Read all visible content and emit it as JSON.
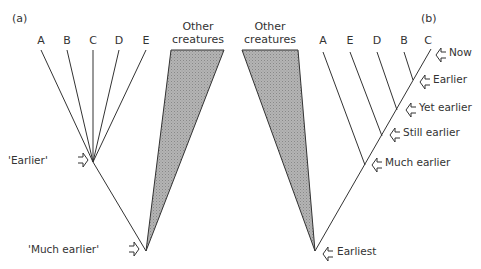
{
  "panel_a": {
    "label": "(a)",
    "leaves": [
      "A",
      "B",
      "C",
      "D",
      "E"
    ],
    "other_label_1": "Other",
    "other_label_2": "creatures",
    "nodes": [
      {
        "label": "'Earlier'"
      },
      {
        "label": "'Much earlier'"
      }
    ]
  },
  "panel_b": {
    "label": "(b)",
    "leaves": [
      "A",
      "E",
      "D",
      "B",
      "C"
    ],
    "other_label_1": "Other",
    "other_label_2": "creatures",
    "nodes": [
      {
        "label": "Now"
      },
      {
        "label": "Earlier"
      },
      {
        "label": "Yet earlier"
      },
      {
        "label": "Still earlier"
      },
      {
        "label": "Much earlier"
      },
      {
        "label": "Earliest"
      }
    ]
  },
  "colors": {
    "line": "#333333",
    "wedge": "#a8a8a8"
  }
}
